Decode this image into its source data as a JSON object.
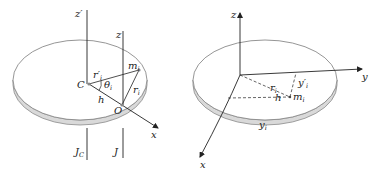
{
  "figures": [
    {
      "id": "left",
      "description": "Disk with parallel axes through center of mass C and point O (parallel axis theorem)",
      "labels": {
        "z_prime": "z′",
        "z": "z",
        "C": "C",
        "O": "O",
        "h": "h",
        "theta": "θ",
        "theta_sub": "i",
        "r_prime": "r′",
        "r_prime_sub": "i",
        "r": "r",
        "r_sub": "i",
        "m": "m",
        "m_sub": "i",
        "x": "x",
        "J_C": "J",
        "J_C_sub": "C",
        "J": "J"
      }
    },
    {
      "id": "right",
      "description": "Disk with x, y, z coordinate axes and mass element m_i (perpendicular axis theorem)",
      "labels": {
        "z": "z",
        "y": "y",
        "x": "x",
        "r": "r",
        "r_sub": "i",
        "h": "h",
        "y_prime": "y′",
        "y_prime_sub": "i",
        "m": "m",
        "m_sub": "i",
        "y_rim": "y",
        "y_rim_sub": "i"
      }
    }
  ],
  "colors": {
    "line": "#222222",
    "disk_edge": "#8a8a8a",
    "disk_side": "#d9d9d9"
  }
}
